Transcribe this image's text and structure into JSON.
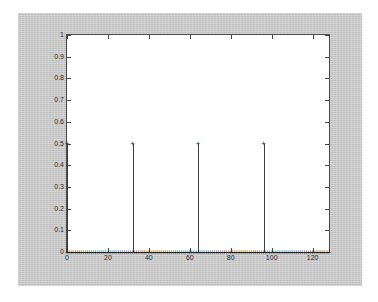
{
  "window": {
    "name": "matlab-figure",
    "background_color": "#c9c9c9",
    "axes_background_color": "#ffffff",
    "axes_line_color": "#4a4a4a"
  },
  "chart_data": {
    "type": "scatter",
    "plot_style": "stem",
    "title": "",
    "subtitle": "",
    "xlabel": "",
    "ylabel": "",
    "xlim": [
      0,
      128
    ],
    "ylim": [
      0,
      1
    ],
    "xticks": [
      0,
      20,
      40,
      60,
      80,
      100,
      120
    ],
    "xticklabels": [
      "0",
      "20",
      "40",
      "60",
      "80",
      "100",
      "120"
    ],
    "yticks": [
      0,
      0.1,
      0.2,
      0.3,
      0.4,
      0.5,
      0.6,
      0.7,
      0.8,
      0.9,
      1
    ],
    "yticklabels": [
      "0",
      "0.1",
      "0.2",
      "0.3",
      "0.4",
      "0.5",
      "0.6",
      "0.7",
      "0.8",
      "0.9",
      "1"
    ],
    "grid": false,
    "legend": null,
    "legend_position": "none",
    "marker": "+",
    "marker_color": "#1e1e1e",
    "line_color": "#3d3d3d",
    "series": [
      {
        "name": "impulse-train",
        "description": "Periodic impulse train of amplitude 0.5 with period 32; zero elsewhere.",
        "period": 32,
        "amplitude": 0.5,
        "baseline_value": 0,
        "n_samples": 129,
        "peaks": [
          {
            "x": 0,
            "y": 0.5
          },
          {
            "x": 32,
            "y": 0.5
          },
          {
            "x": 64,
            "y": 0.5
          },
          {
            "x": 96,
            "y": 0.5
          }
        ]
      }
    ],
    "annotations": []
  }
}
